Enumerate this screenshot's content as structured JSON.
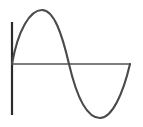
{
  "figure": {
    "width": 143,
    "height": 127,
    "background": "#ffffff",
    "title": "",
    "caption": ""
  },
  "axes": {
    "x_axis": {
      "label": "",
      "color": "#7d7d7d",
      "stroke_width": 2,
      "x_start": 12,
      "x_end": 131,
      "y": 64
    },
    "y_axis": {
      "label": "",
      "color": "#2b2b2b",
      "stroke_width": 2.2,
      "x": 12,
      "y_top": 22,
      "y_bottom": 115
    }
  },
  "curve": {
    "name": "sine-wave",
    "color": "#4a4a4a",
    "stroke_width": 2.1,
    "fill": "none",
    "peak": {
      "x": 42,
      "y": 10
    },
    "trough": {
      "x": 100,
      "y": 118
    },
    "zero_crossings": [
      {
        "x": 12,
        "y": 64
      },
      {
        "x": 69,
        "y": 64
      },
      {
        "x": 130,
        "y": 64
      }
    ],
    "path": "M 12 64 C 18 30, 30 10, 42 10 C 54 10, 62 34, 69 64 C 76 94, 86 118, 100 118 C 112 118, 123 94, 130 64"
  },
  "chart_data": {
    "type": "line",
    "title": "",
    "xlabel": "",
    "ylabel": "",
    "grid": false,
    "legend": null,
    "legend_position": "none",
    "xlim": [
      0,
      1
    ],
    "ylim": [
      -1.1,
      1.1
    ],
    "series": [
      {
        "name": "sine-wave",
        "color": "#4a4a4a",
        "x": [
          0.0,
          0.05,
          0.1,
          0.15,
          0.2,
          0.25,
          0.3,
          0.35,
          0.4,
          0.45,
          0.5,
          0.55,
          0.6,
          0.65,
          0.7,
          0.75,
          0.8,
          0.85,
          0.9,
          0.95,
          1.0
        ],
        "y": [
          0.0,
          0.31,
          0.59,
          0.81,
          0.95,
          1.0,
          0.95,
          0.81,
          0.59,
          0.31,
          0.0,
          -0.31,
          -0.59,
          -0.81,
          -0.95,
          -1.0,
          -0.95,
          -0.81,
          -0.59,
          -0.31,
          0.0
        ]
      }
    ],
    "xticks": [],
    "xticklabels": [],
    "yticks": [],
    "yticklabels": [],
    "annotations": []
  }
}
